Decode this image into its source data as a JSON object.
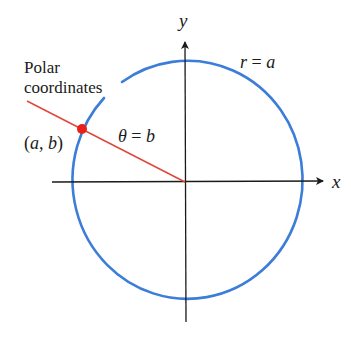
{
  "diagram": {
    "title": "Polar coordinates",
    "labels": {
      "caption_line1": "Polar",
      "caption_line2": "coordinates",
      "point": "(a, b)",
      "angle": "θ = b",
      "circle": "r = a",
      "x_axis": "x",
      "y_axis": "y"
    },
    "colors": {
      "circle": "#3b7dd8",
      "ray": "#e0463c",
      "point": "#e8201a",
      "axes": "#1a1a1a",
      "text": "#1a1a1a"
    },
    "geometry": {
      "origin": [
        185,
        182
      ],
      "circle_rx": 115,
      "circle_ry": 119,
      "point": [
        82,
        129
      ],
      "ray_start": [
        27,
        100
      ]
    }
  }
}
